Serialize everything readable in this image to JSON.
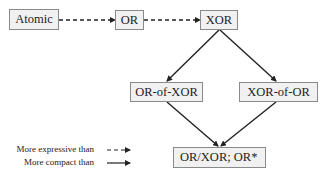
{
  "nodes": {
    "atomic": "Atomic",
    "or": "OR",
    "xor": "XOR",
    "or_of_xor": "OR-of-XOR",
    "xor_of_or": "XOR-of-OR",
    "or_xor_or_star": "OR/XOR; OR*"
  },
  "edges": [
    {
      "from": "Atomic",
      "to": "OR",
      "style": "dashed",
      "meaning": "More expressive than"
    },
    {
      "from": "OR",
      "to": "XOR",
      "style": "dashed",
      "meaning": "More expressive than"
    },
    {
      "from": "XOR",
      "to": "OR-of-XOR",
      "style": "solid",
      "meaning": "More compact than"
    },
    {
      "from": "XOR",
      "to": "XOR-of-OR",
      "style": "solid",
      "meaning": "More compact than"
    },
    {
      "from": "OR-of-XOR",
      "to": "OR/XOR; OR*",
      "style": "solid",
      "meaning": "More compact than"
    },
    {
      "from": "XOR-of-OR",
      "to": "OR/XOR; OR*",
      "style": "solid",
      "meaning": "More compact than"
    }
  ],
  "legend": {
    "dashed_label": "More expressive than",
    "solid_label": "More compact than"
  },
  "colors": {
    "line": "#222222",
    "box_fill": "#f1f1f1",
    "box_border": "#8a8a8a"
  }
}
